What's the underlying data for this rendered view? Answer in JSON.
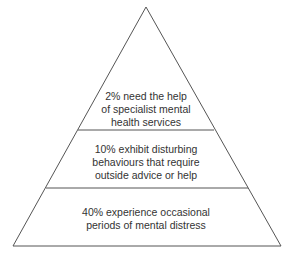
{
  "diagram": {
    "type": "pyramid",
    "stroke_color": "#555555",
    "text_color": "#333333",
    "tiers": [
      {
        "id": "top",
        "lines": [
          "2% need the help",
          "of specialist mental",
          "health services"
        ]
      },
      {
        "id": "middle",
        "lines": [
          "10% exhibit disturbing",
          "behaviours that require",
          "outside advice or help"
        ]
      },
      {
        "id": "bottom",
        "lines": [
          "40% experience occasional",
          "periods of mental distress"
        ]
      }
    ]
  }
}
